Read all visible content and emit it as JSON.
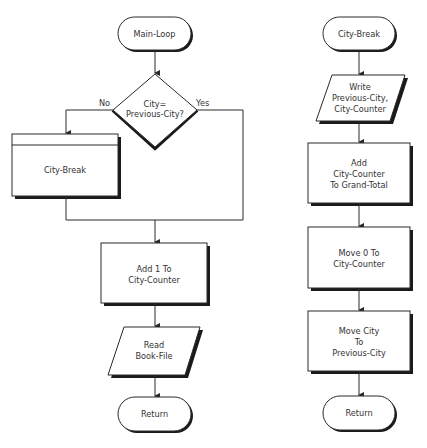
{
  "colors": {
    "stroke": "#2a2a2a",
    "shadow": "#1a1a1a",
    "text": "#333333",
    "background": "#ffffff"
  },
  "left_flow": {
    "start": {
      "label": "Main-Loop",
      "shape": "terminator"
    },
    "decision": {
      "line1": "City=",
      "line2": "Previous-City?",
      "shape": "diamond",
      "no_label": "No",
      "yes_label": "Yes"
    },
    "subprocess": {
      "label": "City-Break",
      "shape": "predefined-process"
    },
    "process": {
      "line1": "Add 1 To",
      "line2": "City-Counter",
      "shape": "process"
    },
    "io": {
      "line1": "Read",
      "line2": "Book-File",
      "shape": "parallelogram"
    },
    "end": {
      "label": "Return",
      "shape": "terminator"
    }
  },
  "right_flow": {
    "start": {
      "label": "City-Break",
      "shape": "terminator"
    },
    "io": {
      "line1": "Write",
      "line2": "Previous-City,",
      "line3": "City-Counter",
      "shape": "parallelogram"
    },
    "process1": {
      "line1": "Add",
      "line2": "City-Counter",
      "line3": "To Grand-Total",
      "shape": "process"
    },
    "process2": {
      "line1": "Move 0 To",
      "line2": "City-Counter",
      "shape": "process"
    },
    "process3": {
      "line1": "Move City",
      "line2": "To",
      "line3": "Previous-City",
      "shape": "process"
    },
    "end": {
      "label": "Return",
      "shape": "terminator"
    }
  }
}
